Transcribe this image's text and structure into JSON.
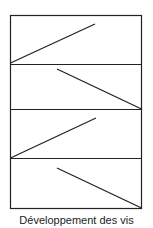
{
  "figure": {
    "caption": "Développement des vis",
    "stroke_color": "#222222",
    "panels": [
      {
        "id": 1,
        "line": "ascending"
      },
      {
        "id": 2,
        "line": "descending"
      },
      {
        "id": 3,
        "line": "ascending"
      },
      {
        "id": 4,
        "line": "descending"
      }
    ]
  }
}
